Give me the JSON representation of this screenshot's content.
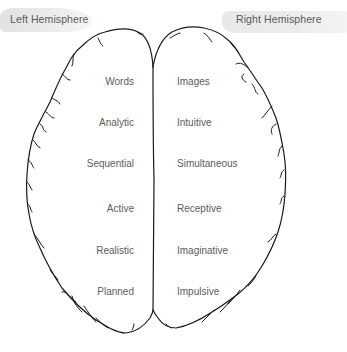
{
  "titles": {
    "left": "Left Hemisphere",
    "right": "Right Hemisphere"
  },
  "traits": {
    "left": [
      "Words",
      "Analytic",
      "Sequential",
      "Active",
      "Realistic",
      "Planned"
    ],
    "right": [
      "Images",
      "Intuitive",
      "Simultaneous",
      "Receptive",
      "Imaginative",
      "Impulsive"
    ]
  },
  "colors": {
    "outline": "#1a1a1a",
    "label_band": "#ebebeb",
    "text": "#5c5c5c"
  }
}
